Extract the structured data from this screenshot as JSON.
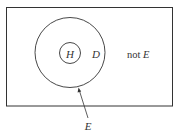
{
  "diagram": {
    "type": "venn",
    "universe": {
      "label": "not E"
    },
    "outer_set": {
      "label_inside": "D",
      "pointer_label": "E"
    },
    "inner_set": {
      "label": "H"
    },
    "labels": {
      "H": "H",
      "D": "D",
      "not_prefix": "not ",
      "not_E_var": "E",
      "E_pointer": "E"
    },
    "colors": {
      "stroke": "#333333",
      "background": "#ffffff"
    }
  }
}
